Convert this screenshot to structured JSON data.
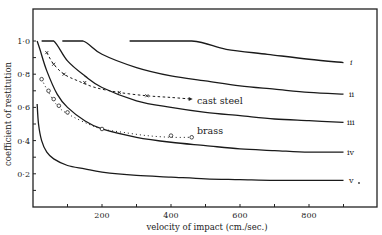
{
  "chart_data": {
    "type": "line",
    "title": "",
    "xlabel": "velocity of impact (cm./sec.)",
    "ylabel": "coefficient of restitution",
    "xlim": [
      0,
      1000
    ],
    "ylim": [
      0,
      1.2
    ],
    "x_ticks": [
      100,
      200,
      300,
      400,
      500,
      600,
      700,
      800,
      900
    ],
    "x_tick_labels": [
      {
        "value": 200,
        "label": "200"
      },
      {
        "value": 400,
        "label": "400"
      },
      {
        "value": 600,
        "label": "600"
      },
      {
        "value": 800,
        "label": "800"
      }
    ],
    "y_ticks": [
      0.1,
      0.2,
      0.3,
      0.4,
      0.5,
      0.6,
      0.7,
      0.8,
      0.9,
      1.0
    ],
    "y_tick_labels": [
      {
        "value": 1.0,
        "label": "1·0"
      },
      {
        "value": 0.8,
        "label": "0·8"
      },
      {
        "value": 0.6,
        "label": "0·6"
      },
      {
        "value": 0.4,
        "label": "0·4"
      },
      {
        "value": 0.2,
        "label": "0·2"
      }
    ],
    "grid": false,
    "legend": "inline labels at right end of curves",
    "series": [
      {
        "name": "i",
        "style": "solid",
        "x": [
          280,
          460,
          560,
          680,
          800,
          900
        ],
        "y": [
          1.0,
          1.0,
          0.95,
          0.92,
          0.89,
          0.87
        ]
      },
      {
        "name": "ii",
        "style": "solid",
        "x": [
          85,
          145,
          200,
          300,
          400,
          500,
          600,
          700,
          800,
          900
        ],
        "y": [
          1.0,
          1.0,
          0.92,
          0.84,
          0.79,
          0.76,
          0.73,
          0.71,
          0.69,
          0.68
        ]
      },
      {
        "name": "iii",
        "style": "solid",
        "x": [
          25,
          60,
          100,
          150,
          200,
          300,
          400,
          500,
          600,
          700,
          800,
          900
        ],
        "y": [
          1.0,
          1.0,
          0.88,
          0.79,
          0.72,
          0.64,
          0.6,
          0.57,
          0.55,
          0.53,
          0.52,
          0.51
        ]
      },
      {
        "name": "iv",
        "style": "solid",
        "x": [
          12,
          20,
          40,
          70,
          100,
          150,
          200,
          300,
          400,
          500,
          600,
          700,
          800,
          900
        ],
        "y": [
          1.0,
          0.95,
          0.82,
          0.68,
          0.6,
          0.52,
          0.47,
          0.42,
          0.39,
          0.37,
          0.35,
          0.34,
          0.33,
          0.33
        ]
      },
      {
        "name": "v",
        "style": "solid",
        "x": [
          12,
          16,
          25,
          40,
          60,
          100,
          150,
          200,
          300,
          400,
          500,
          600,
          700,
          800,
          900
        ],
        "y": [
          0.62,
          0.5,
          0.4,
          0.33,
          0.29,
          0.25,
          0.23,
          0.21,
          0.19,
          0.18,
          0.17,
          0.165,
          0.16,
          0.16,
          0.16
        ]
      },
      {
        "name": "cast steel",
        "style": "dashed-with-x-markers",
        "x": [
          40,
          60,
          90,
          130,
          180,
          250,
          330,
          400,
          460
        ],
        "y": [
          0.93,
          0.86,
          0.8,
          0.76,
          0.72,
          0.69,
          0.67,
          0.66,
          0.65
        ]
      },
      {
        "name": "brass",
        "style": "dotted-with-circle-markers",
        "x": [
          25,
          40,
          60,
          80,
          110,
          160,
          200,
          260,
          330,
          400,
          460
        ],
        "y": [
          0.77,
          0.71,
          0.64,
          0.59,
          0.55,
          0.5,
          0.47,
          0.45,
          0.43,
          0.42,
          0.42
        ]
      }
    ],
    "markers": {
      "cast_steel_x_markers": [
        [
          40,
          0.93
        ],
        [
          60,
          0.86
        ],
        [
          90,
          0.8
        ],
        [
          150,
          0.75
        ],
        [
          250,
          0.69
        ],
        [
          330,
          0.67
        ]
      ],
      "brass_circle_markers": [
        [
          25,
          0.77
        ],
        [
          45,
          0.7
        ],
        [
          60,
          0.65
        ],
        [
          75,
          0.61
        ],
        [
          100,
          0.57
        ],
        [
          200,
          0.47
        ],
        [
          400,
          0.43
        ],
        [
          460,
          0.42
        ]
      ]
    }
  },
  "labels": {
    "xlabel": "velocity of impact (cm./sec.)",
    "ylabel": "coefficient of restitution",
    "cast_steel": "cast steel",
    "brass": "brass",
    "curve_i": "i",
    "curve_ii": "ii",
    "curve_iii": "iii",
    "curve_iv": "iv",
    "curve_v": "v"
  }
}
